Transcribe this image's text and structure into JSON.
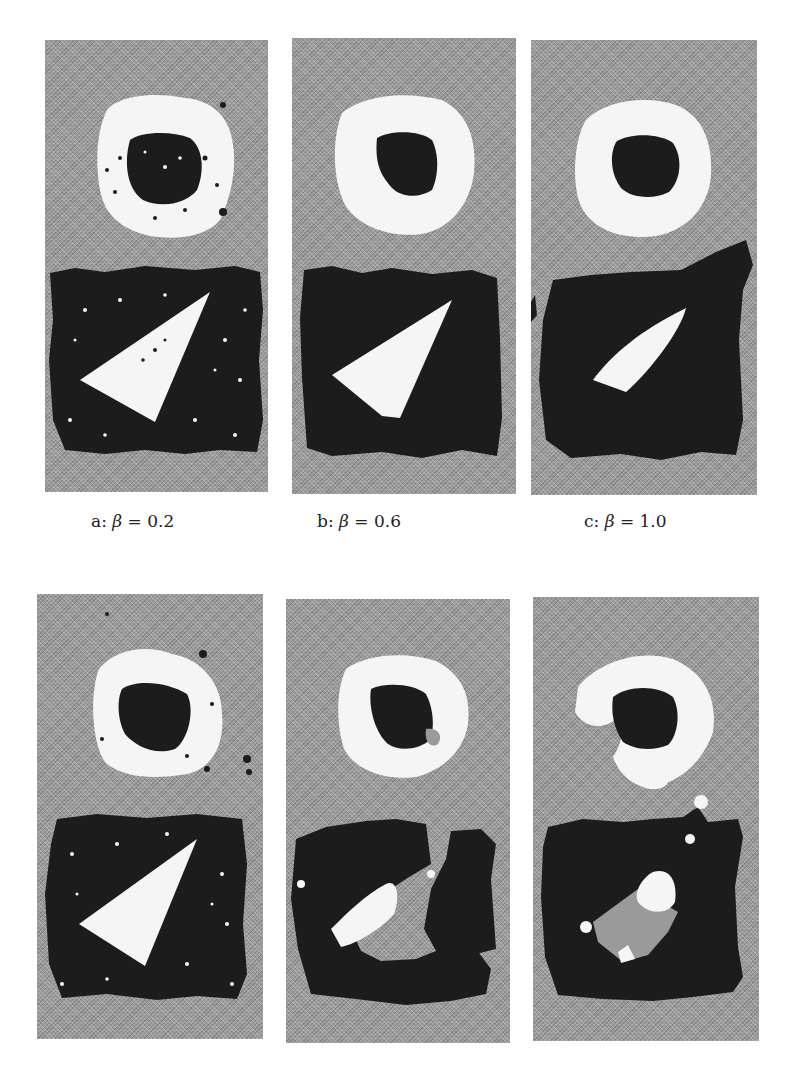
{
  "figure": {
    "colors": {
      "background_class": "#9a9a9a",
      "bright_class": "#f7f7f7",
      "dark_class": "#1c1c1c"
    },
    "top_row": [
      {
        "id": "a",
        "caption_prefix": "a:",
        "symbol": "β",
        "equals": "=",
        "value": "0.2"
      },
      {
        "id": "b",
        "caption_prefix": "b:",
        "symbol": "β",
        "equals": "=",
        "value": "0.6"
      },
      {
        "id": "c",
        "caption_prefix": "c:",
        "symbol": "β",
        "equals": "=",
        "value": "1.0"
      }
    ],
    "bottom_row": [
      {
        "id": "d"
      },
      {
        "id": "e"
      },
      {
        "id": "f"
      }
    ]
  }
}
